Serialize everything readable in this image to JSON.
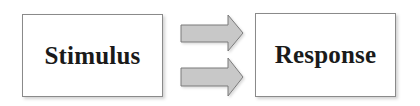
{
  "diagram": {
    "nodes": [
      {
        "id": "stimulus",
        "label": "Stimulus"
      },
      {
        "id": "response",
        "label": "Response"
      }
    ],
    "edges": [
      {
        "from": "stimulus",
        "to": "response",
        "style": "block-arrow"
      },
      {
        "from": "stimulus",
        "to": "response",
        "style": "block-arrow"
      }
    ],
    "colors": {
      "box_border": "#8a8a8a",
      "box_fill": "#ffffff",
      "arrow_fill": "#c8c8c8",
      "arrow_stroke": "#7a7a7a",
      "text": "#1a1a1a"
    }
  }
}
